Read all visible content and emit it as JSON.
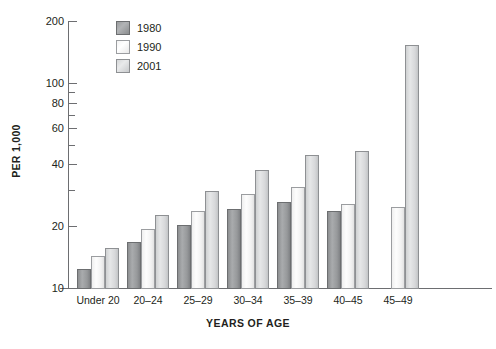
{
  "chart_data": {
    "type": "bar",
    "title": "",
    "xlabel": "YEARS OF AGE",
    "ylabel": "PER 1,000",
    "yscale": "log",
    "ylim": [
      10,
      200
    ],
    "ytick_labels": [
      "200",
      "100",
      "80",
      "60",
      "40",
      "20",
      "10"
    ],
    "ytick_values": [
      200,
      100,
      80,
      60,
      40,
      20,
      10
    ],
    "minor_ytick_values": [
      90,
      70,
      50,
      30
    ],
    "grid": false,
    "legend_position": "top-left-inside",
    "categories": [
      "Under 20",
      "20–24",
      "25–29",
      "30–34",
      "35–39",
      "40–45",
      "45–49"
    ],
    "series": [
      {
        "name": "1980",
        "color": "#9a9c9e",
        "values": [
          12.5,
          17,
          20.5,
          24.5,
          26.5,
          24,
          null
        ]
      },
      {
        "name": "1990",
        "color": "#f5f5f5",
        "values": [
          14.5,
          19.5,
          24,
          29,
          31.5,
          26,
          25
        ]
      },
      {
        "name": "2001",
        "color": "#d7d8da",
        "values": [
          15.8,
          23,
          30,
          38,
          45,
          47,
          155
        ]
      }
    ]
  },
  "legend": {
    "entries": [
      {
        "label": "1980"
      },
      {
        "label": "1990"
      },
      {
        "label": "2001"
      }
    ]
  },
  "axes": {
    "y_title": "PER 1,000",
    "x_title": "YEARS OF AGE"
  }
}
